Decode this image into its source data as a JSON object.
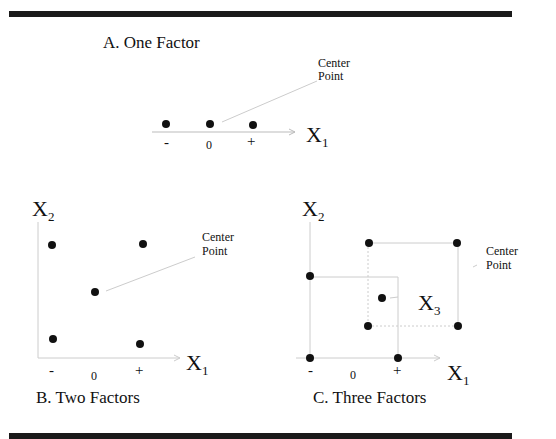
{
  "panels": {
    "a": {
      "title": "A. One Factor",
      "axis_label": "X",
      "axis_sub": "1",
      "ticks": [
        "-",
        "0",
        "+"
      ],
      "annotation_line1": "Center",
      "annotation_line2": "Point"
    },
    "b": {
      "title": "B. Two Factors",
      "x_label": "X",
      "x_sub": "1",
      "y_label": "X",
      "y_sub": "2",
      "ticks": [
        "-",
        "0",
        "+"
      ],
      "annotation_line1": "Center",
      "annotation_line2": "Point"
    },
    "c": {
      "title": "C. Three Factors",
      "x_label": "X",
      "x_sub": "1",
      "y_label": "X",
      "y_sub": "2",
      "z_label": "X",
      "z_sub": "3",
      "ticks": [
        "-",
        "0",
        "+"
      ],
      "annotation_line1": "Center",
      "annotation_line2": "Point"
    }
  }
}
